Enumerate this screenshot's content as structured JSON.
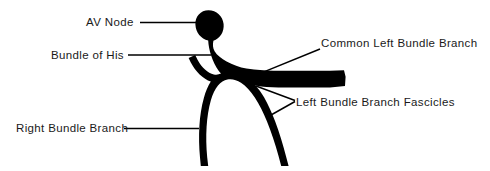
{
  "figure": {
    "type": "anatomical-line-diagram",
    "background_color": "#ffffff",
    "ink_color": "#000000",
    "width": 490,
    "height": 171
  },
  "labels": {
    "av_node": {
      "text": "AV Node",
      "leader": "horizontal-line-right",
      "points_to": "av-node-bulb"
    },
    "bundle_of_his": {
      "text": "Bundle of His",
      "leader": "horizontal-line-right",
      "points_to": "bundle-of-his-trunk"
    },
    "right_bundle_branch": {
      "text": "Right Bundle Branch",
      "leader": "horizontal-line-right",
      "points_to": "right-bundle-branch-limb"
    },
    "common_left_bundle_branch": {
      "text": "Common Left Bundle Branch",
      "leader": "diagonal-line-down-left",
      "points_to": "left-bundle-band"
    },
    "left_bundle_branch_fascicles": {
      "text": "Left Bundle Branch Fascicles",
      "leader": "bracket-two-lines-left",
      "points_to": "fascicle-limbs"
    }
  },
  "structures": {
    "av_node": "oval bulb at top of conduction pathway",
    "bundle_of_his": "narrow neck descending from AV node",
    "common_left_bundle": "thick horizontal band extending right",
    "fascicles": "two descending limbs branching downward",
    "right_bundle_branch": "left descending limb"
  }
}
